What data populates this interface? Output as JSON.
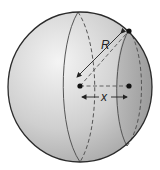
{
  "diagram": {
    "labels": {
      "radius": "R",
      "distance": "x"
    },
    "colors": {
      "sphere_fill_light": "#f2f2f2",
      "sphere_fill_dark": "#a9a9a9",
      "cap_fill": "#9c9c9c",
      "outline": "#2a2a2a",
      "line": "#555555"
    },
    "points": [
      {
        "name": "sphere-center"
      },
      {
        "name": "section-center"
      },
      {
        "name": "section-edge-point"
      }
    ]
  }
}
